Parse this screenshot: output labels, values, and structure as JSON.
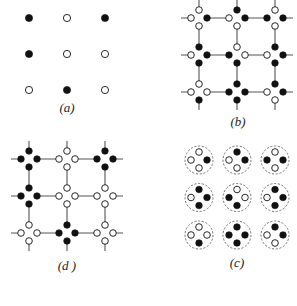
{
  "figure": {
    "panels": [
      {
        "id": "a",
        "label": "(a)",
        "type": "spin-lattice",
        "origin": [
          29,
          18
        ],
        "spacing": [
          38,
          36
        ],
        "label_pos": [
          67,
          112
        ],
        "sites": [
          [
            "filled",
            "open",
            "filled"
          ],
          [
            "filled",
            "open",
            "open"
          ],
          [
            "open",
            "filled",
            "open"
          ]
        ]
      },
      {
        "id": "b",
        "label": "(b)",
        "type": "bond-network",
        "origin": [
          199,
          18
        ],
        "spacing": [
          38,
          37
        ],
        "label_pos": [
          238,
          126
        ],
        "nodes": [
          [
            {
              "top": "open",
              "left": "open",
              "right": "filled",
              "bottom": "open"
            },
            {
              "top": "filled",
              "left": "open",
              "right": "filled",
              "bottom": "open"
            },
            {
              "top": "open",
              "left": "filled",
              "right": "filled",
              "bottom": "open"
            }
          ],
          [
            {
              "top": "filled",
              "left": "open",
              "right": "filled",
              "bottom": "filled"
            },
            {
              "top": "open",
              "left": "filled",
              "right": "open",
              "bottom": "filled"
            },
            {
              "top": "filled",
              "left": "open",
              "right": "filled",
              "bottom": "filled"
            }
          ],
          [
            {
              "top": "open",
              "left": "open",
              "right": "open",
              "bottom": "filled"
            },
            {
              "top": "filled",
              "left": "filled",
              "right": "filled",
              "bottom": "filled"
            },
            {
              "top": "filled",
              "left": "open",
              "right": "filled",
              "bottom": "open"
            }
          ]
        ]
      },
      {
        "id": "d",
        "label": "(d )",
        "type": "bond-network",
        "origin": [
          29,
          159
        ],
        "spacing": [
          38,
          37
        ],
        "label_pos": [
          67,
          270
        ],
        "nodes": [
          [
            {
              "top": "filled",
              "left": "filled",
              "right": "filled",
              "bottom": "filled"
            },
            {
              "top": "open",
              "left": "open",
              "right": "open",
              "bottom": "open"
            },
            {
              "top": "filled",
              "left": "filled",
              "right": "filled",
              "bottom": "filled"
            }
          ],
          [
            {
              "top": "filled",
              "left": "filled",
              "right": "filled",
              "bottom": "filled"
            },
            {
              "top": "open",
              "left": "open",
              "right": "open",
              "bottom": "open"
            },
            {
              "top": "open",
              "left": "open",
              "right": "open",
              "bottom": "open"
            }
          ],
          [
            {
              "top": "open",
              "left": "open",
              "right": "open",
              "bottom": "open"
            },
            {
              "top": "filled",
              "left": "filled",
              "right": "filled",
              "bottom": "filled"
            },
            {
              "top": "open",
              "left": "open",
              "right": "open",
              "bottom": "open"
            }
          ]
        ]
      },
      {
        "id": "c",
        "label": "(c)",
        "type": "plaquette-clusters",
        "origin": [
          199,
          160
        ],
        "spacing": [
          38,
          37.5
        ],
        "label_pos": [
          237,
          267
        ],
        "nodes": [
          [
            {
              "top": "open",
              "left": "open",
              "right": "filled",
              "bottom": "open"
            },
            {
              "top": "filled",
              "left": "open",
              "right": "filled",
              "bottom": "open"
            },
            {
              "top": "open",
              "left": "filled",
              "right": "filled",
              "bottom": "open"
            }
          ],
          [
            {
              "top": "filled",
              "left": "open",
              "right": "filled",
              "bottom": "filled"
            },
            {
              "top": "open",
              "left": "filled",
              "right": "open",
              "bottom": "filled"
            },
            {
              "top": "filled",
              "left": "open",
              "right": "filled",
              "bottom": "filled"
            }
          ],
          [
            {
              "top": "open",
              "left": "open",
              "right": "open",
              "bottom": "filled"
            },
            {
              "top": "filled",
              "left": "filled",
              "right": "filled",
              "bottom": "filled"
            },
            {
              "top": "filled",
              "left": "open",
              "right": "filled",
              "bottom": "open"
            }
          ]
        ]
      }
    ],
    "colors": {
      "ink": "#111111",
      "line": "#555555",
      "dashed": "#666666",
      "open_fill": "#ffffff"
    }
  }
}
